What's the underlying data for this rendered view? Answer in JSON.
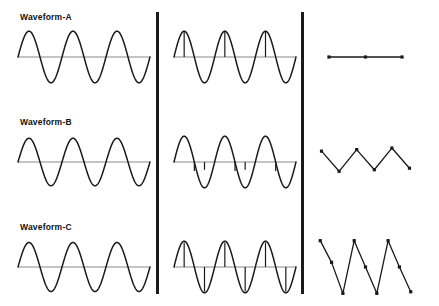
{
  "figure": {
    "title": "",
    "background_color": "#ffffff",
    "stroke_color": "#1a1a1a",
    "baseline_color": "#8a8a8a",
    "divider_color": "#1a1a1a",
    "dividers": [
      {
        "name": "divider-1",
        "x": 156
      },
      {
        "name": "divider-2",
        "x": 301
      }
    ]
  },
  "rows": [
    {
      "id": "a",
      "label": "Waveform-A",
      "label_x": 20,
      "label_y": 12
    },
    {
      "id": "b",
      "label": "Waveform-B",
      "label_x": 20,
      "label_y": 117
    },
    {
      "id": "c",
      "label": "Waveform-C",
      "label_x": 20,
      "label_y": 222
    }
  ],
  "chart_data": [
    {
      "id": "a-continuous",
      "name": "waveform-a-continuous",
      "type": "line",
      "title": "Waveform-A continuous sine",
      "xlabel": "",
      "ylabel": "",
      "grid": false,
      "legend": "none",
      "baseline": true,
      "cycles": 3,
      "amplitude": 1.0,
      "phase": 0,
      "xlim": [
        0,
        3
      ],
      "ylim": [
        -1.2,
        1.2
      ],
      "markers": false,
      "stems": false
    },
    {
      "id": "a-sampled",
      "name": "waveform-a-sampled",
      "type": "line",
      "title": "Waveform-A sampled sine with stems",
      "xlabel": "",
      "ylabel": "",
      "grid": false,
      "legend": "none",
      "baseline": true,
      "cycles": 3,
      "amplitude": 1.0,
      "phase": 0,
      "xlim": [
        0,
        3
      ],
      "ylim": [
        -1.2,
        1.2
      ],
      "markers": false,
      "stems": true,
      "stem_positions": [
        0.25,
        1.25,
        2.25
      ],
      "stem_values": [
        1.0,
        1.0,
        1.0
      ],
      "stem_direction": "up"
    },
    {
      "id": "a-discrete",
      "name": "waveform-a-discrete",
      "type": "line",
      "title": "Waveform-A discrete samples",
      "xlabel": "",
      "ylabel": "",
      "grid": false,
      "legend": "none",
      "baseline": false,
      "markers": true,
      "marker_style": "square",
      "x": [
        0,
        1,
        2
      ],
      "values": [
        0,
        0,
        0
      ],
      "xlim": [
        -0.3,
        2.3
      ],
      "ylim": [
        -1.0,
        1.0
      ]
    },
    {
      "id": "b-continuous",
      "name": "waveform-b-continuous",
      "type": "line",
      "title": "Waveform-B continuous sine",
      "xlabel": "",
      "ylabel": "",
      "grid": false,
      "legend": "none",
      "baseline": true,
      "cycles": 3,
      "amplitude": 0.92,
      "phase": 0,
      "xlim": [
        0,
        3
      ],
      "ylim": [
        -1.2,
        1.2
      ],
      "markers": false,
      "stems": false
    },
    {
      "id": "b-sampled",
      "name": "waveform-b-sampled",
      "type": "line",
      "title": "Waveform-B sampled sine",
      "xlabel": "",
      "ylabel": "",
      "grid": false,
      "legend": "none",
      "baseline": true,
      "cycles": 3,
      "amplitude": 1.0,
      "phase": 0,
      "xlim": [
        0,
        3
      ],
      "ylim": [
        -1.2,
        1.2
      ],
      "markers": false,
      "stems": true,
      "stem_positions": [
        0.5,
        0.75,
        1.5,
        1.75,
        2.5
      ],
      "stem_values": [
        -0.35,
        -0.3,
        -0.35,
        -0.3,
        -0.35
      ],
      "stem_direction": "down"
    },
    {
      "id": "b-discrete",
      "name": "waveform-b-discrete",
      "type": "line",
      "title": "Waveform-B discrete samples",
      "xlabel": "",
      "ylabel": "",
      "grid": false,
      "legend": "none",
      "baseline": false,
      "markers": true,
      "marker_style": "square",
      "x": [
        0,
        1,
        2,
        3,
        4,
        5
      ],
      "values": [
        0.35,
        -0.3,
        0.4,
        -0.25,
        0.45,
        -0.2
      ],
      "xlim": [
        -0.2,
        5.2
      ],
      "ylim": [
        -1.0,
        1.0
      ]
    },
    {
      "id": "c-continuous",
      "name": "waveform-c-continuous",
      "type": "line",
      "title": "Waveform-C continuous sine",
      "xlabel": "",
      "ylabel": "",
      "grid": false,
      "legend": "none",
      "baseline": true,
      "cycles": 3,
      "amplitude": 0.95,
      "phase": 0,
      "xlim": [
        0,
        3
      ],
      "ylim": [
        -1.2,
        1.2
      ],
      "markers": false,
      "stems": false
    },
    {
      "id": "c-sampled",
      "name": "waveform-c-sampled",
      "type": "line",
      "title": "Waveform-C sampled sine with bipolar stems",
      "xlabel": "",
      "ylabel": "",
      "grid": false,
      "legend": "none",
      "baseline": true,
      "cycles": 3,
      "amplitude": 1.0,
      "phase": 0,
      "xlim": [
        0,
        3
      ],
      "ylim": [
        -1.2,
        1.2
      ],
      "markers": false,
      "stems": true,
      "stem_positions": [
        0.25,
        0.75,
        1.25,
        1.75,
        2.25,
        2.75
      ],
      "stem_values": [
        0.95,
        -0.95,
        0.95,
        -0.95,
        0.95,
        -0.95
      ],
      "stem_direction": "both"
    },
    {
      "id": "c-discrete",
      "name": "waveform-c-discrete",
      "type": "line",
      "title": "Waveform-C discrete samples",
      "xlabel": "",
      "ylabel": "",
      "grid": false,
      "legend": "none",
      "baseline": false,
      "markers": true,
      "marker_style": "square",
      "x": [
        0,
        1,
        2,
        3,
        4,
        5,
        6,
        7,
        8
      ],
      "values": [
        0.85,
        0.15,
        -0.85,
        0.85,
        0.0,
        -0.85,
        0.85,
        0.0,
        -0.8
      ],
      "xlim": [
        -0.2,
        8.2
      ],
      "ylim": [
        -1.0,
        1.0
      ]
    }
  ]
}
